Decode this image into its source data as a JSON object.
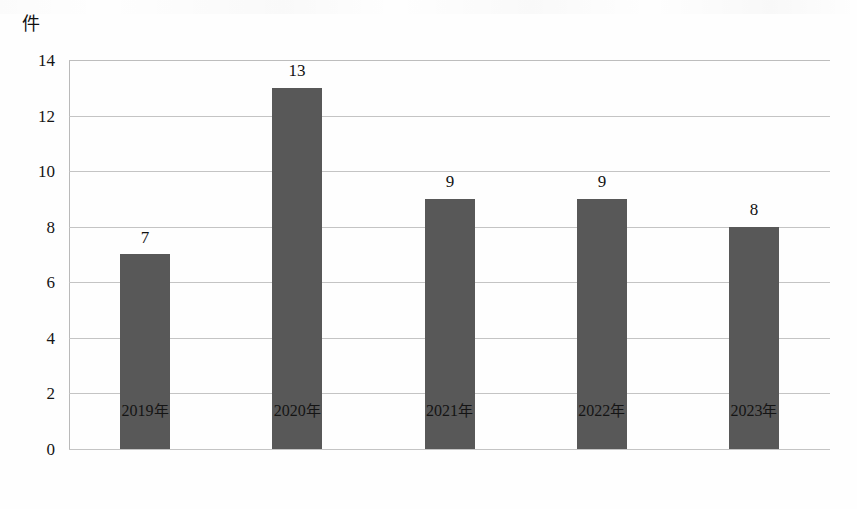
{
  "axis": {
    "unit_label": "件",
    "y_ticks": [
      "14",
      "12",
      "10",
      "8",
      "6",
      "4",
      "2",
      "0"
    ]
  },
  "colors": {
    "bar": "#585858",
    "gridline": "#c4c4c4",
    "axis": "#8e8e8e",
    "text": "#121212"
  },
  "chart_data": {
    "type": "bar",
    "title": "",
    "subtitle": "",
    "xlabel": "",
    "ylabel": "件",
    "ylim": [
      0,
      14
    ],
    "ytick_step": 2,
    "grid": true,
    "legend": false,
    "legend_position": "none",
    "categories": [
      "2019年",
      "2020年",
      "2021年",
      "2022年",
      "2023年"
    ],
    "values": [
      7,
      13,
      9,
      9,
      8
    ],
    "data_labels": [
      "7",
      "13",
      "9",
      "9",
      "8"
    ],
    "series": [
      {
        "name": "件数",
        "values": [
          7,
          13,
          9,
          9,
          8
        ],
        "color": "#585858"
      }
    ],
    "points": [
      {
        "category": "2019年",
        "value": 7,
        "label": "7"
      },
      {
        "category": "2020年",
        "value": 13,
        "label": "13"
      },
      {
        "category": "2021年",
        "value": 9,
        "label": "9"
      },
      {
        "category": "2022年",
        "value": 9,
        "label": "9"
      },
      {
        "category": "2023年",
        "value": 8,
        "label": "8"
      }
    ]
  }
}
